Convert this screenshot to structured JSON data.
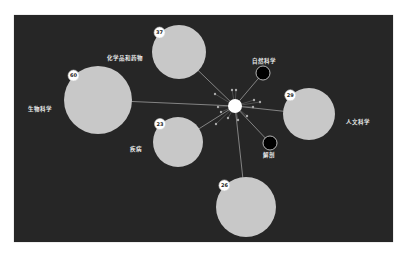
{
  "graph": {
    "background": "#262626",
    "node_fill": "#c8c8c8",
    "edge_color": "#9a9a9a",
    "center": {
      "x": 235,
      "y": 106,
      "r": 7,
      "fill": "#ffffff"
    },
    "nodes": [
      {
        "id": "chem",
        "label": "化学品和药物",
        "count": "37",
        "x": 179,
        "y": 52,
        "r": 27,
        "label_x": 107,
        "label_y": 60
      },
      {
        "id": "bio",
        "label": "生物科学",
        "count": "60",
        "x": 98,
        "y": 100,
        "r": 34,
        "label_x": 28,
        "label_y": 111
      },
      {
        "id": "human",
        "label": "人文科学",
        "count": "29",
        "x": 309,
        "y": 114,
        "r": 26,
        "label_x": 346,
        "label_y": 124
      },
      {
        "id": "disease",
        "label": "疾病",
        "count": "23",
        "x": 178,
        "y": 142,
        "r": 25,
        "label_x": 130,
        "label_y": 151
      },
      {
        "id": "anat",
        "label": "",
        "count": "26",
        "x": 246,
        "y": 207,
        "r": 30,
        "label_x": 0,
        "label_y": 0
      }
    ],
    "dark_nodes": [
      {
        "id": "natsci",
        "label": "自然科学",
        "x": 263,
        "y": 73,
        "r": 7,
        "label_x": 252,
        "label_y": 63
      },
      {
        "id": "anatomy",
        "label": "解剖",
        "x": 270,
        "y": 143,
        "r": 7,
        "label_x": 263,
        "label_y": 157
      }
    ],
    "satellites": [
      {
        "x": 232,
        "y": 90
      },
      {
        "x": 236,
        "y": 90
      },
      {
        "x": 215,
        "y": 94
      },
      {
        "x": 254,
        "y": 100
      },
      {
        "x": 260,
        "y": 102
      },
      {
        "x": 218,
        "y": 107
      },
      {
        "x": 253,
        "y": 107
      },
      {
        "x": 221,
        "y": 112
      },
      {
        "x": 228,
        "y": 118
      },
      {
        "x": 238,
        "y": 120
      },
      {
        "x": 216,
        "y": 124
      },
      {
        "x": 247,
        "y": 116
      }
    ]
  }
}
